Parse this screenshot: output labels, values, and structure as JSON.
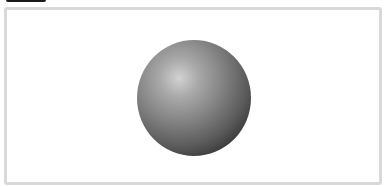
{
  "canvas": {
    "width": 385,
    "height": 186,
    "background": "#ffffff"
  },
  "header": {
    "cropped_label": "",
    "cropped_bar_color": "#1a1a1a"
  },
  "frame": {
    "border_color": "#d9d9d9"
  },
  "figure": {
    "shape": "sphere",
    "center": [
      194,
      98
    ],
    "radius": 57,
    "highlight_color": "#d2d2d2",
    "shadow_color": "#101010"
  }
}
